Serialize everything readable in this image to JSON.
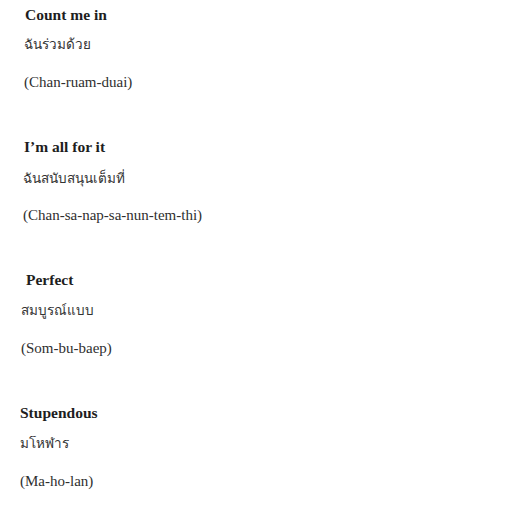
{
  "phrases": [
    {
      "english": "Count me in",
      "thai": "ฉันร่วมด้วย",
      "romanization": "(Chan-ruam-duai)"
    },
    {
      "english": "I’m all for it",
      "thai": "ฉันสนับสนุนเต็มที่",
      "romanization": "(Chan-sa-nap-sa-nun-tem-thi)"
    },
    {
      "english": "Perfect",
      "thai": "สมบูรณ์แบบ",
      "romanization": "(Som-bu-baep)"
    },
    {
      "english": "Stupendous",
      "thai": "มโหฬาร",
      "romanization": "(Ma-ho-lan)"
    }
  ]
}
